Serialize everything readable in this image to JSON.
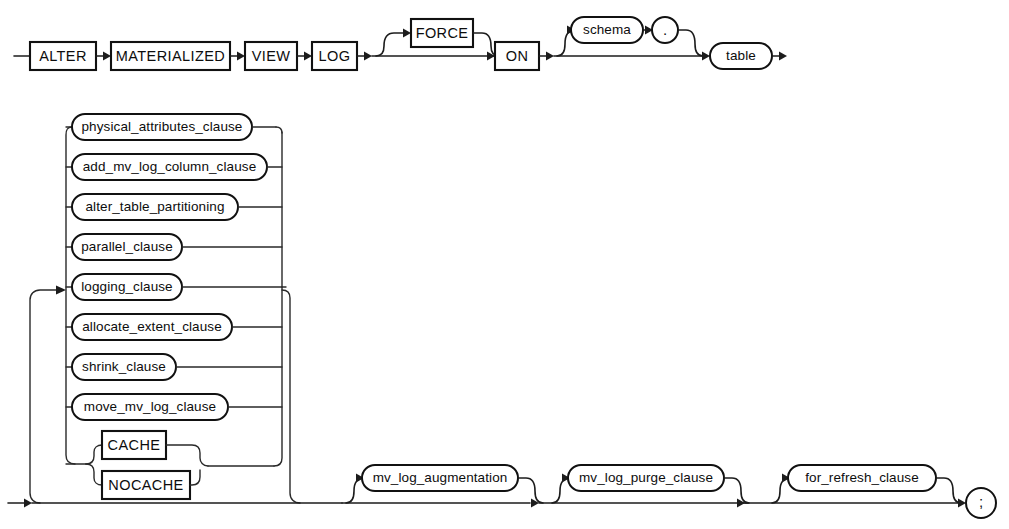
{
  "diagram": {
    "type": "railroad-syntax-diagram",
    "colors": {
      "background": "#ffffff",
      "stroke": "#111111",
      "text": "#0d0d0d"
    },
    "row1": {
      "keywords": [
        {
          "id": "alter",
          "label": "ALTER",
          "shape": "box"
        },
        {
          "id": "materialized",
          "label": "MATERIALIZED",
          "shape": "box"
        },
        {
          "id": "view",
          "label": "VIEW",
          "shape": "box"
        },
        {
          "id": "log",
          "label": "LOG",
          "shape": "box"
        }
      ],
      "optional_force": {
        "id": "force",
        "label": "FORCE",
        "shape": "box"
      },
      "on_keyword": {
        "id": "on",
        "label": "ON",
        "shape": "box"
      },
      "schema": {
        "id": "schema",
        "label": "schema",
        "shape": "oval"
      },
      "dot": {
        "id": "dot",
        "label": ".",
        "shape": "oval"
      },
      "table": {
        "id": "table",
        "label": "table",
        "shape": "oval"
      }
    },
    "clause_stack": [
      {
        "id": "physical_attributes_clause",
        "label": "physical_attributes_clause",
        "shape": "oval"
      },
      {
        "id": "add_mv_log_column_clause",
        "label": "add_mv_log_column_clause",
        "shape": "oval"
      },
      {
        "id": "alter_table_partitioning",
        "label": "alter_table_partitioning",
        "shape": "oval"
      },
      {
        "id": "parallel_clause",
        "label": "parallel_clause",
        "shape": "oval"
      },
      {
        "id": "logging_clause",
        "label": "logging_clause",
        "shape": "oval"
      },
      {
        "id": "allocate_extent_clause",
        "label": "allocate_extent_clause",
        "shape": "oval"
      },
      {
        "id": "shrink_clause",
        "label": "shrink_clause",
        "shape": "oval"
      },
      {
        "id": "move_mv_log_clause",
        "label": "move_mv_log_clause",
        "shape": "oval"
      }
    ],
    "cache_group": [
      {
        "id": "cache",
        "label": "CACHE",
        "shape": "box"
      },
      {
        "id": "nocache",
        "label": "NOCACHE",
        "shape": "box"
      }
    ],
    "row_bottom": [
      {
        "id": "mv_log_augmentation",
        "label": "mv_log_augmentation",
        "shape": "oval"
      },
      {
        "id": "mv_log_purge_clause",
        "label": "mv_log_purge_clause",
        "shape": "oval"
      },
      {
        "id": "for_refresh_clause",
        "label": "for_refresh_clause",
        "shape": "oval"
      }
    ],
    "terminator": {
      "id": "semicolon",
      "label": ";",
      "shape": "circle"
    }
  }
}
